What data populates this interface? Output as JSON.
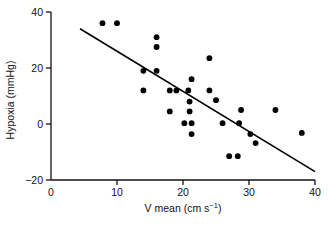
{
  "chart_data": {
    "type": "scatter",
    "title": "",
    "xlabel": "V mean (cm s−1)",
    "xlabel_main": "V mean (cm s",
    "xlabel_sup": "−1",
    "xlabel_tail": ")",
    "ylabel": "Hypoxia (mmHg)",
    "xlim": [
      0,
      40
    ],
    "ylim": [
      -20,
      40
    ],
    "xticks": [
      0,
      10,
      20,
      30,
      40
    ],
    "yticks": [
      -20,
      0,
      20,
      40
    ],
    "xtick_labels": [
      "0",
      "10",
      "20",
      "30",
      "40"
    ],
    "ytick_labels": [
      "−20",
      "0",
      "20",
      "40"
    ],
    "grid": false,
    "legend": "none",
    "marker": "filled-circle",
    "marker_color": "#000000",
    "marker_size_px": 4.6,
    "points": [
      {
        "x": 7.8,
        "y": 36.0
      },
      {
        "x": 10.0,
        "y": 36.0
      },
      {
        "x": 16.0,
        "y": 31.0
      },
      {
        "x": 16.0,
        "y": 27.5
      },
      {
        "x": 14.0,
        "y": 19.0
      },
      {
        "x": 16.0,
        "y": 19.0
      },
      {
        "x": 24.0,
        "y": 23.5
      },
      {
        "x": 21.3,
        "y": 16.0
      },
      {
        "x": 14.0,
        "y": 12.0
      },
      {
        "x": 18.0,
        "y": 12.0
      },
      {
        "x": 19.0,
        "y": 12.0
      },
      {
        "x": 20.8,
        "y": 12.0
      },
      {
        "x": 24.0,
        "y": 12.0
      },
      {
        "x": 21.0,
        "y": 8.0
      },
      {
        "x": 25.0,
        "y": 8.5
      },
      {
        "x": 18.0,
        "y": 4.5
      },
      {
        "x": 21.0,
        "y": 4.5
      },
      {
        "x": 28.8,
        "y": 5.0
      },
      {
        "x": 34.0,
        "y": 5.0
      },
      {
        "x": 20.2,
        "y": 0.3
      },
      {
        "x": 21.3,
        "y": 0.3
      },
      {
        "x": 26.0,
        "y": 0.3
      },
      {
        "x": 28.5,
        "y": 0.3
      },
      {
        "x": 21.3,
        "y": -3.6
      },
      {
        "x": 30.2,
        "y": -3.6
      },
      {
        "x": 38.0,
        "y": -3.2
      },
      {
        "x": 31.0,
        "y": -6.8
      },
      {
        "x": 27.0,
        "y": -11.5
      },
      {
        "x": 28.3,
        "y": -11.5
      }
    ],
    "regression_line": {
      "x_start": 4.4,
      "y_start": 34.0,
      "x_end": 40.0,
      "y_end": -17.0,
      "color": "#000000",
      "width_px": 1.6
    }
  }
}
